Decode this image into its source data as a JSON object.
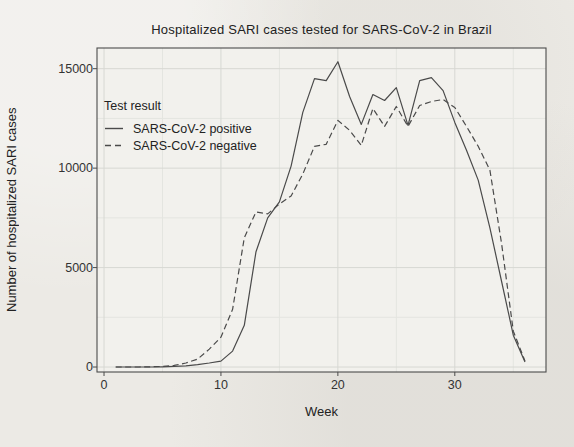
{
  "page": {
    "background_color": "#eceae5",
    "text_color": "#262626"
  },
  "chart_data": {
    "type": "line",
    "title": "Hospitalized SARI cases tested for SARS-CoV-2 in Brazil",
    "xlabel": "Week",
    "ylabel": "Number of hospitalized SARI cases",
    "x_ticks": [
      0,
      10,
      20,
      30
    ],
    "x_minor_ticks": [
      5,
      15,
      25,
      35
    ],
    "y_ticks": [
      0,
      5000,
      10000,
      15000
    ],
    "y_minor_ticks": [
      2500,
      7500,
      12500
    ],
    "xlim": [
      -0.6,
      37.8
    ],
    "ylim": [
      -250,
      16040
    ],
    "grid": true,
    "panel_fill": "#f2f1ed",
    "grid_major_color": "#d7d8d3",
    "grid_minor_color": "#e4e5e0",
    "border_color": "#4c4c4c",
    "line_color": "#4a4a4a",
    "legend": {
      "title": "Test result",
      "position": "top-left-inside"
    },
    "x": [
      1,
      2,
      3,
      4,
      5,
      6,
      7,
      8,
      9,
      10,
      11,
      12,
      13,
      14,
      15,
      16,
      17,
      18,
      19,
      20,
      21,
      22,
      23,
      24,
      25,
      26,
      27,
      28,
      29,
      30,
      31,
      32,
      33,
      34,
      35,
      36
    ],
    "series": [
      {
        "name": "SARS-CoV-2 positive",
        "linestyle": "solid",
        "color": "#4a4a4a",
        "values": [
          0,
          0,
          0,
          0,
          10,
          30,
          60,
          120,
          200,
          300,
          800,
          2100,
          5800,
          7500,
          8300,
          10100,
          12800,
          14500,
          14400,
          15350,
          13600,
          12200,
          13700,
          13400,
          14050,
          12150,
          14400,
          14550,
          13900,
          12300,
          10900,
          9400,
          7000,
          4300,
          1600,
          250
        ]
      },
      {
        "name": "SARS-CoV-2 negative",
        "linestyle": "dashed",
        "color": "#4a4a4a",
        "values": [
          0,
          0,
          0,
          10,
          30,
          80,
          200,
          400,
          900,
          1500,
          2900,
          6500,
          7800,
          7700,
          8200,
          8600,
          9700,
          11100,
          11200,
          12400,
          11900,
          11150,
          13000,
          12100,
          13100,
          12100,
          13150,
          13350,
          13450,
          13050,
          12100,
          11100,
          9900,
          6200,
          1800,
          300
        ]
      }
    ]
  }
}
